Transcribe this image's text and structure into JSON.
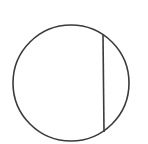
{
  "diagram": {
    "type": "geometry",
    "background": "#ffffff",
    "stroke_color": "#3a3a3a",
    "stroke_width": 1.6,
    "circle": {
      "cx": 71,
      "cy": 83,
      "r": 58
    },
    "chord": {
      "x1": 103,
      "y1": 35,
      "x2": 104,
      "y2": 132
    }
  }
}
